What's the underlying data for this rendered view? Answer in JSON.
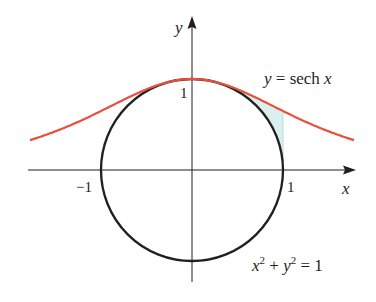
{
  "chart_data": {
    "type": "line",
    "title": "",
    "xlabel": "x",
    "ylabel": "y",
    "x_ticks": [
      "-1",
      "1"
    ],
    "y_ticks": [
      "1"
    ],
    "xlim": [
      -1.78,
      1.78
    ],
    "ylim": [
      -1.1,
      1.7
    ],
    "grid": false,
    "series": [
      {
        "name": "y = sech x",
        "equation": "y = sech(x)",
        "color": "#e8503a",
        "x": [
          -1.78,
          -1.5,
          -1.0,
          -0.5,
          0,
          0.5,
          1.0,
          1.5,
          1.78
        ],
        "y": [
          0.33,
          0.43,
          0.65,
          0.89,
          1.0,
          0.89,
          0.65,
          0.43,
          0.33
        ]
      },
      {
        "name": "x^2 + y^2 = 1",
        "equation": "x^2 + y^2 = 1",
        "color": "#231f20",
        "shape": "circle",
        "center": [
          0,
          0
        ],
        "radius": 1
      }
    ],
    "shaded_region": {
      "description": "region between sech curve and circle",
      "x_from": 0.55,
      "x_to": 1.0,
      "color": "#d9f0ee"
    },
    "annotations": [
      {
        "text": "y = sech x",
        "near": [
          1.5,
          0.85
        ]
      },
      {
        "text": "x² + y² = 1",
        "near": [
          1.4,
          -0.95
        ]
      }
    ]
  },
  "labels": {
    "y_axis": "y",
    "x_axis": "x",
    "tick_neg1": "−1",
    "tick_pos1": "1",
    "tick_y1": "1",
    "sech_label_y": "y",
    "sech_label_rest": " = sech ",
    "sech_label_x": "x",
    "circle_x": "x",
    "circle_sup1": "2",
    "circle_plus": " + ",
    "circle_y": "y",
    "circle_sup2": "2",
    "circle_eq": " = 1"
  }
}
